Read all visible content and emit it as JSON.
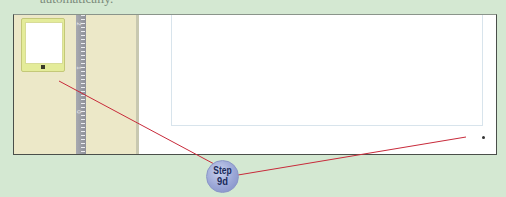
{
  "header": {
    "cut_text": "automatically."
  },
  "thumbnail_pane": {
    "slides": [
      {
        "number": "1",
        "selected": true
      }
    ]
  },
  "ruler": {
    "labels": [
      "2",
      "1",
      "0"
    ]
  },
  "callout": {
    "step_label": "Step",
    "step_number": "9d",
    "line_color": "#c82a3a",
    "badge_color": "#9aa6d6"
  },
  "colors": {
    "background": "#d4e8d2",
    "thumbnail_pane": "#ece8c8",
    "thumbnail_selected": "#e4ec9a",
    "ruler": "#9a9ca4",
    "frame_border": "#4a4f4a"
  }
}
